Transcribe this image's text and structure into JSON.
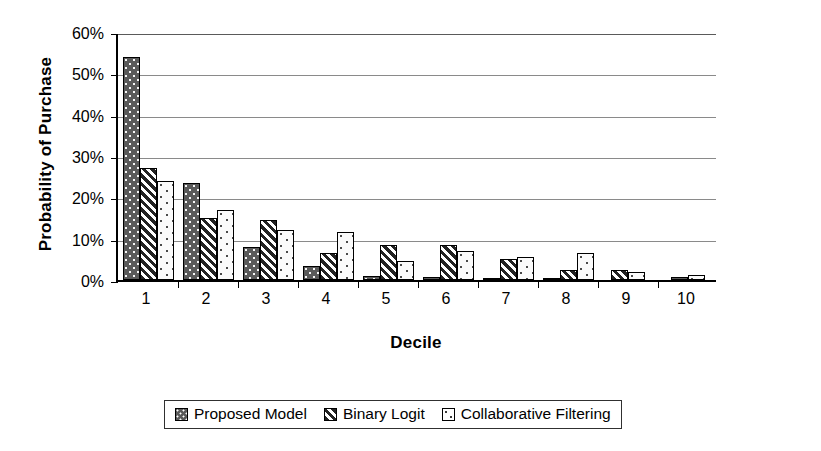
{
  "chart_data": {
    "type": "bar",
    "title": "",
    "xlabel": "Decile",
    "ylabel": "Probability of Purchase",
    "categories": [
      "1",
      "2",
      "3",
      "4",
      "5",
      "6",
      "7",
      "8",
      "9",
      "10"
    ],
    "ylim": [
      0,
      60
    ],
    "ytick_labels": [
      "0%",
      "10%",
      "20%",
      "30%",
      "40%",
      "50%",
      "60%"
    ],
    "ytick_values": [
      0,
      10,
      20,
      30,
      40,
      50,
      60
    ],
    "grid": true,
    "legend_position": "bottom",
    "series": [
      {
        "name": "Proposed Model",
        "pattern": "dotted-dark-gray",
        "color": "#5a5a5a",
        "values": [
          54,
          23.5,
          8,
          3.5,
          1,
          0.7,
          0.5,
          0.4,
          0,
          0.7
        ]
      },
      {
        "name": "Binary Logit",
        "pattern": "diagonal-hatch",
        "color": "#222222",
        "values": [
          27,
          15,
          14.5,
          6.5,
          8.5,
          8.5,
          5,
          2.5,
          2.5,
          0
        ]
      },
      {
        "name": "Collaborative Filtering",
        "pattern": "sparse-dots-white",
        "color": "#ffffff",
        "values": [
          24,
          17,
          12,
          11.5,
          4.5,
          7,
          5.5,
          6.5,
          2,
          1.2
        ]
      }
    ]
  },
  "legend": {
    "items": [
      {
        "label": "Proposed Model"
      },
      {
        "label": "Binary Logit"
      },
      {
        "label": "Collaborative Filtering"
      }
    ]
  }
}
